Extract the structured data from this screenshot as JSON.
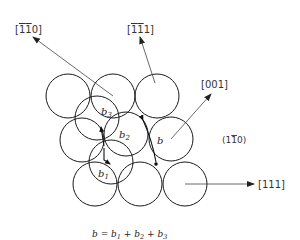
{
  "diagram": {
    "type": "crystal-slip-plane",
    "plane_label": "(1̅0)",
    "plane_label_text": "(1",
    "plane_label_bar_digit": "1",
    "plane_label_tail": "0)",
    "directions": [
      {
        "id": "m1m10",
        "label": "[īī0]",
        "prefix": "[",
        "bar1": "1",
        "bar2": "1",
        "tail": "0]"
      },
      {
        "id": "m1m11",
        "label": "[īī1]",
        "prefix": "[",
        "bar1": "1",
        "bar2": "1",
        "tail": "1]"
      },
      {
        "id": "001",
        "label": "[001]"
      },
      {
        "id": "111",
        "label": "[111]"
      }
    ],
    "vector_labels": {
      "b": "b",
      "b1": "b",
      "b1_sub": "1",
      "b2": "b",
      "b2_sub": "2",
      "b3": "b",
      "b3_sub": "3"
    },
    "equation": {
      "lhs": "b",
      "eq": " = ",
      "t1": "b",
      "s1": "1",
      "plus1": " + ",
      "t2": "b",
      "s2": "2",
      "plus2": " + ",
      "t3": "b",
      "s3": "3"
    },
    "colors": {
      "line": "#1a1a1a",
      "arrow": "#444444",
      "text": "#333333",
      "background": "#ffffff"
    }
  }
}
